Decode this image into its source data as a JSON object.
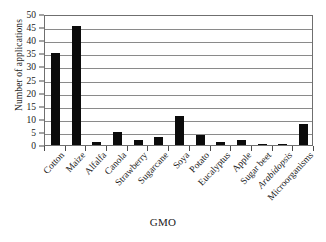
{
  "chart_data": {
    "type": "bar",
    "title": "",
    "xlabel": "GMO",
    "ylabel": "Number of applications",
    "categories": [
      "Cotton",
      "Maize",
      "Alfalfa",
      "Canola",
      "Strawberry",
      "Sugarcane",
      "Soya",
      "Potato",
      "Eucalyptus",
      "Apple",
      "Sugar beet",
      "Arabidopsis",
      "Microorganisms"
    ],
    "values": [
      35,
      45.5,
      1,
      5,
      2,
      3,
      11,
      4,
      1,
      2,
      0.5,
      0.5,
      8
    ],
    "italic_categories": [
      "Arabidopsis"
    ],
    "ylim": [
      0,
      50
    ],
    "ytick_step": 5,
    "yticks": [
      "0",
      "5",
      "10",
      "15",
      "20",
      "25",
      "30",
      "35",
      "40",
      "45",
      "50"
    ],
    "grid": "horizontal",
    "legend": "none",
    "bar_color": "#0b0b0b",
    "axis_color": "#6f6f6f",
    "grid_color": "#8a8a8a",
    "background": "#ffffff"
  }
}
